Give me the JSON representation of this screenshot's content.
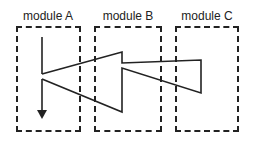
{
  "modules": [
    {
      "label": "module A"
    },
    {
      "label": "module B"
    },
    {
      "label": "module C"
    }
  ],
  "colors": {
    "line": "#222222",
    "background": "#ffffff"
  }
}
